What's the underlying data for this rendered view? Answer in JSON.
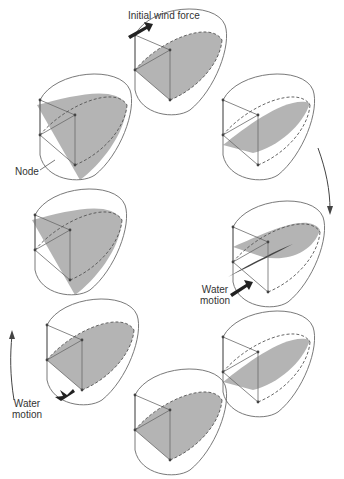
{
  "labels": {
    "wind": "Initial wind force",
    "node": "Node",
    "water_right_1": "Water",
    "water_right_2": "motion",
    "water_left_1": "Water",
    "water_left_2": "motion"
  },
  "colors": {
    "outline": "#6a6a6a",
    "fill": "#b4b4b4",
    "dark_fill": "#444444",
    "arrow": "#222222"
  },
  "basins": [
    {
      "id": "top",
      "cx": 170,
      "cy": 55,
      "tilt": "flat-front"
    },
    {
      "id": "upper-right",
      "cx": 258,
      "cy": 120,
      "tilt": "right-high"
    },
    {
      "id": "right",
      "cx": 268,
      "cy": 250,
      "tilt": "twisted"
    },
    {
      "id": "lower-right",
      "cx": 258,
      "cy": 360,
      "tilt": "right-high"
    },
    {
      "id": "bottom",
      "cx": 170,
      "cy": 415,
      "tilt": "flat-front"
    },
    {
      "id": "lower-left",
      "cx": 82,
      "cy": 345,
      "tilt": "flat-front"
    },
    {
      "id": "left",
      "cx": 70,
      "cy": 235,
      "tilt": "left-high"
    },
    {
      "id": "upper-left",
      "cx": 75,
      "cy": 120,
      "tilt": "left-high"
    }
  ]
}
